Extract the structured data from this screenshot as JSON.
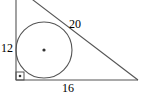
{
  "figure": {
    "kind": "right-triangle-with-inscribed-circle",
    "stroke_color": "#555555",
    "background_color": "#ffffff",
    "text_color": "#000000",
    "labels": {
      "vertical_leg": "12",
      "horizontal_leg": "16",
      "hypotenuse": "20"
    },
    "geometry": {
      "vertices": {
        "top": {
          "x": 16,
          "y": -13
        },
        "bottom_left": {
          "x": 16,
          "y": 80
        },
        "bottom_right": {
          "x": 138,
          "y": 80
        }
      },
      "incircle": {
        "center": {
          "x": 44,
          "y": 50
        },
        "radius": 28,
        "center_dot_radius": 1.6
      },
      "right_angle_marker": {
        "corner": {
          "x": 16,
          "y": 80
        },
        "size": 8,
        "has_center_dot": true
      }
    }
  }
}
